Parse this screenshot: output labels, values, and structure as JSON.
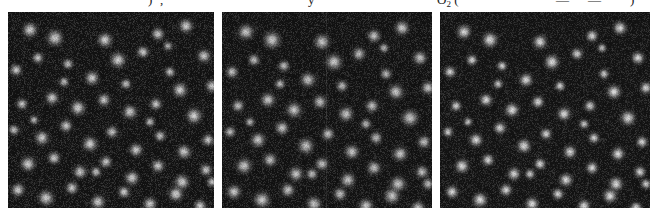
{
  "figure": {
    "background_color": "#ffffff",
    "width": 656,
    "height": 220,
    "kind": "three-panel grayscale fluorescence microscopy comparison"
  },
  "caption_strip": {
    "description": "bottom sliver of the preceding caption line, clipped by the top edge of the screenshot",
    "fragments": [
      {
        "text": ")",
        "x": 148
      },
      {
        "text": ",",
        "x": 160
      },
      {
        "text": "y",
        "x": 308
      },
      {
        "text": "O",
        "sub": "2",
        "suffix": " (",
        "x": 437
      },
      {
        "text": "—",
        "x": 556
      },
      {
        "text": "—",
        "x": 588
      },
      {
        "text": ")",
        "x": 630
      }
    ]
  },
  "panels": [
    {
      "id": "panel-1",
      "label": "left-panel",
      "x": 8,
      "y": 12,
      "width": 206,
      "height": 196,
      "background_color": "#131313",
      "blob_sigma": 5.6,
      "blob_peak": 0.92,
      "noise_opacity": 0.55,
      "seam": null,
      "spots": [
        [
          22,
          18,
          1.0
        ],
        [
          47,
          26,
          1.1
        ],
        [
          97,
          28,
          1.0
        ],
        [
          150,
          22,
          0.85
        ],
        [
          178,
          14,
          0.95
        ],
        [
          8,
          58,
          0.8
        ],
        [
          30,
          46,
          0.75
        ],
        [
          60,
          52,
          0.7
        ],
        [
          84,
          66,
          0.95
        ],
        [
          110,
          48,
          1.05
        ],
        [
          135,
          40,
          0.8
        ],
        [
          162,
          60,
          0.7
        ],
        [
          196,
          44,
          0.9
        ],
        [
          172,
          78,
          1.0
        ],
        [
          204,
          74,
          0.85
        ],
        [
          14,
          92,
          0.75
        ],
        [
          44,
          86,
          0.9
        ],
        [
          70,
          96,
          1.0
        ],
        [
          96,
          88,
          0.85
        ],
        [
          122,
          100,
          0.95
        ],
        [
          148,
          92,
          0.8
        ],
        [
          186,
          104,
          1.05
        ],
        [
          6,
          118,
          0.7
        ],
        [
          34,
          126,
          0.95
        ],
        [
          58,
          114,
          0.85
        ],
        [
          82,
          132,
          1.0
        ],
        [
          104,
          120,
          0.8
        ],
        [
          128,
          138,
          0.9
        ],
        [
          152,
          124,
          0.75
        ],
        [
          176,
          140,
          0.95
        ],
        [
          200,
          128,
          0.8
        ],
        [
          20,
          152,
          1.0
        ],
        [
          46,
          146,
          0.85
        ],
        [
          72,
          160,
          0.9
        ],
        [
          98,
          150,
          0.8
        ],
        [
          124,
          166,
          0.95
        ],
        [
          150,
          154,
          0.85
        ],
        [
          174,
          170,
          1.0
        ],
        [
          198,
          158,
          0.8
        ],
        [
          10,
          178,
          0.9
        ],
        [
          38,
          186,
          1.05
        ],
        [
          64,
          176,
          0.85
        ],
        [
          90,
          190,
          0.95
        ],
        [
          116,
          180,
          0.8
        ],
        [
          142,
          192,
          0.9
        ],
        [
          168,
          182,
          1.0
        ],
        [
          192,
          194,
          0.85
        ],
        [
          56,
          70,
          0.65
        ],
        [
          118,
          72,
          0.7
        ],
        [
          142,
          110,
          0.65
        ],
        [
          88,
          160,
          0.7
        ],
        [
          26,
          108,
          0.6
        ],
        [
          160,
          34,
          0.6
        ],
        [
          204,
          170,
          0.7
        ]
      ]
    },
    {
      "id": "panel-2",
      "label": "middle-panel",
      "x": 222,
      "y": 12,
      "width": 210,
      "height": 196,
      "background_color": "#131313",
      "blob_sigma": 6.2,
      "blob_peak": 0.88,
      "noise_opacity": 0.52,
      "seam": {
        "x_offset": 104
      },
      "spots": [
        [
          24,
          20,
          0.95
        ],
        [
          50,
          28,
          1.05
        ],
        [
          100,
          30,
          0.95
        ],
        [
          152,
          24,
          0.8
        ],
        [
          180,
          16,
          0.9
        ],
        [
          10,
          60,
          0.75
        ],
        [
          32,
          48,
          0.7
        ],
        [
          62,
          54,
          0.68
        ],
        [
          86,
          68,
          0.9
        ],
        [
          112,
          50,
          1.0
        ],
        [
          137,
          42,
          0.78
        ],
        [
          164,
          62,
          0.68
        ],
        [
          198,
          46,
          0.85
        ],
        [
          174,
          80,
          0.95
        ],
        [
          206,
          76,
          0.8
        ],
        [
          16,
          94,
          0.72
        ],
        [
          46,
          88,
          0.88
        ],
        [
          72,
          98,
          0.95
        ],
        [
          98,
          90,
          0.82
        ],
        [
          124,
          102,
          0.9
        ],
        [
          150,
          94,
          0.78
        ],
        [
          188,
          106,
          1.0
        ],
        [
          8,
          120,
          0.68
        ],
        [
          36,
          128,
          0.9
        ],
        [
          60,
          116,
          0.82
        ],
        [
          84,
          134,
          0.95
        ],
        [
          106,
          122,
          0.78
        ],
        [
          130,
          140,
          0.88
        ],
        [
          154,
          126,
          0.72
        ],
        [
          178,
          142,
          0.9
        ],
        [
          202,
          130,
          0.78
        ],
        [
          22,
          154,
          0.95
        ],
        [
          48,
          148,
          0.82
        ],
        [
          74,
          162,
          0.88
        ],
        [
          100,
          152,
          0.78
        ],
        [
          126,
          168,
          0.9
        ],
        [
          152,
          156,
          0.82
        ],
        [
          176,
          172,
          0.95
        ],
        [
          200,
          160,
          0.78
        ],
        [
          12,
          180,
          0.88
        ],
        [
          40,
          188,
          1.0
        ],
        [
          66,
          178,
          0.82
        ],
        [
          92,
          192,
          0.9
        ],
        [
          118,
          182,
          0.78
        ],
        [
          144,
          194,
          0.88
        ],
        [
          170,
          184,
          0.95
        ],
        [
          196,
          196,
          0.82
        ],
        [
          58,
          72,
          0.62
        ],
        [
          120,
          74,
          0.68
        ],
        [
          144,
          112,
          0.62
        ],
        [
          90,
          162,
          0.68
        ],
        [
          28,
          110,
          0.58
        ],
        [
          162,
          36,
          0.58
        ],
        [
          206,
          172,
          0.68
        ]
      ]
    },
    {
      "id": "panel-3",
      "label": "right-panel",
      "x": 440,
      "y": 12,
      "width": 210,
      "height": 196,
      "background_color": "#141414",
      "blob_sigma": 5.0,
      "blob_peak": 1.0,
      "noise_opacity": 0.5,
      "seam": null,
      "spots": [
        [
          24,
          20,
          1.05
        ],
        [
          50,
          28,
          1.15
        ],
        [
          100,
          30,
          1.05
        ],
        [
          152,
          24,
          0.9
        ],
        [
          180,
          16,
          1.0
        ],
        [
          10,
          60,
          0.85
        ],
        [
          32,
          48,
          0.8
        ],
        [
          62,
          54,
          0.75
        ],
        [
          86,
          68,
          1.0
        ],
        [
          112,
          50,
          1.1
        ],
        [
          137,
          42,
          0.85
        ],
        [
          164,
          62,
          0.75
        ],
        [
          198,
          46,
          0.95
        ],
        [
          174,
          80,
          1.05
        ],
        [
          206,
          76,
          0.9
        ],
        [
          16,
          94,
          0.8
        ],
        [
          46,
          88,
          0.95
        ],
        [
          72,
          98,
          1.05
        ],
        [
          98,
          90,
          0.9
        ],
        [
          124,
          102,
          1.0
        ],
        [
          150,
          94,
          0.85
        ],
        [
          188,
          106,
          1.1
        ],
        [
          8,
          120,
          0.75
        ],
        [
          36,
          128,
          1.0
        ],
        [
          60,
          116,
          0.9
        ],
        [
          84,
          134,
          1.05
        ],
        [
          106,
          122,
          0.85
        ],
        [
          130,
          140,
          0.95
        ],
        [
          154,
          126,
          0.8
        ],
        [
          178,
          142,
          1.0
        ],
        [
          202,
          130,
          0.85
        ],
        [
          22,
          154,
          1.05
        ],
        [
          48,
          148,
          0.9
        ],
        [
          74,
          162,
          0.95
        ],
        [
          100,
          152,
          0.85
        ],
        [
          126,
          168,
          1.0
        ],
        [
          152,
          156,
          0.9
        ],
        [
          176,
          172,
          1.05
        ],
        [
          200,
          160,
          0.85
        ],
        [
          12,
          180,
          0.95
        ],
        [
          40,
          188,
          1.1
        ],
        [
          66,
          178,
          0.9
        ],
        [
          92,
          192,
          1.0
        ],
        [
          118,
          182,
          0.85
        ],
        [
          144,
          194,
          0.95
        ],
        [
          170,
          184,
          1.05
        ],
        [
          196,
          196,
          0.9
        ],
        [
          58,
          72,
          0.7
        ],
        [
          120,
          74,
          0.75
        ],
        [
          144,
          112,
          0.7
        ],
        [
          90,
          162,
          0.75
        ],
        [
          28,
          110,
          0.65
        ],
        [
          162,
          36,
          0.65
        ],
        [
          206,
          172,
          0.75
        ]
      ]
    }
  ]
}
